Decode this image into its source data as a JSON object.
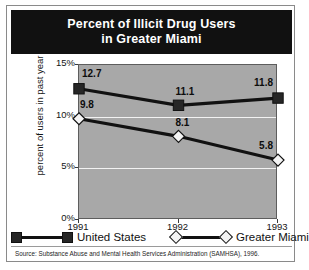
{
  "title": {
    "line1": "Percent of Illicit Drug Users",
    "line2": "in Greater Miami"
  },
  "axes": {
    "y_title": "percent of users in past year",
    "y_ticks": [
      "15%",
      "10%",
      "5%",
      "0%"
    ],
    "x_ticks": [
      "1991",
      "1992",
      "1993"
    ]
  },
  "legend": {
    "items": [
      {
        "label": "United States",
        "marker": "filled-square-marker",
        "color": "#262626"
      },
      {
        "label": "Greater Miami",
        "marker": "hollow-diamond-marker",
        "color": "#f4f4f4"
      }
    ]
  },
  "source": {
    "text": "Source: Substance Abuse and Mental Health Services Administration (SAMHSA), 1996."
  },
  "colors": {
    "title_bar": "#111111",
    "plot_background": "#a8a8a8",
    "gridline": "#f2f2f2",
    "series_line": "#111111",
    "frame": "#8a8a8a"
  },
  "chart_data": {
    "type": "line",
    "title": "Percent of Illicit Drug Users in Greater Miami",
    "xlabel": "",
    "ylabel": "percent of users in past year",
    "categories": [
      "1991",
      "1992",
      "1993"
    ],
    "x": [
      1991,
      1992,
      1993
    ],
    "ylim": [
      0,
      15
    ],
    "yticks": [
      0,
      5,
      10,
      15
    ],
    "ytick_labels": [
      "0%",
      "5%",
      "10%",
      "15%"
    ],
    "grid": true,
    "legend_position": "bottom",
    "series": [
      {
        "name": "United States",
        "values": [
          12.7,
          11.1,
          11.8
        ],
        "labels": [
          "12.7",
          "11.1",
          "11.8"
        ],
        "marker": "filled-square",
        "color": "#262626"
      },
      {
        "name": "Greater Miami",
        "values": [
          9.8,
          8.1,
          5.8
        ],
        "labels": [
          "9.8",
          "8.1",
          "5.8"
        ],
        "marker": "hollow-diamond",
        "color": "#f4f4f4"
      }
    ],
    "source": "Source: Substance Abuse and Mental Health Services Administration (SAMHSA), 1996."
  }
}
